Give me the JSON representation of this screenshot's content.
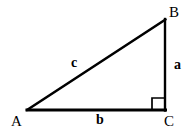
{
  "figure": {
    "background_color": "#ffffff",
    "stroke_color": "#000000",
    "width": 195,
    "height": 133
  },
  "vertices": [
    {
      "id": "A",
      "label": "A",
      "x": 27,
      "y": 110,
      "label_x": 11,
      "label_y": 114
    },
    {
      "id": "B",
      "label": "B",
      "x": 165,
      "y": 20,
      "label_x": 169,
      "label_y": 5
    },
    {
      "id": "C",
      "label": "C",
      "x": 165,
      "y": 110,
      "label_x": 164,
      "label_y": 114
    }
  ],
  "sides": [
    {
      "id": "a",
      "label": "a",
      "from": "B",
      "to": "C",
      "label_x": 174,
      "label_y": 58
    },
    {
      "id": "b",
      "label": "b",
      "from": "A",
      "to": "C",
      "label_x": 96,
      "label_y": 113
    },
    {
      "id": "c",
      "label": "c",
      "from": "A",
      "to": "B",
      "label_x": 71,
      "label_y": 56
    }
  ],
  "right_angle": {
    "at_vertex": "C",
    "marker": "square",
    "x": 152,
    "y": 97,
    "size": 11
  },
  "geometry": {
    "hypotenuse_path": "M 27 110 L 165 20",
    "vertical_path": "M 165 20 L 165 110",
    "base_path": "M 27 110 L 165 110",
    "right_angle_path": "M 152 110 L 152 98 L 164 98",
    "stroke_width_thin": 2,
    "stroke_width_thick": 3,
    "right_angle_stroke_width": 1.6
  }
}
